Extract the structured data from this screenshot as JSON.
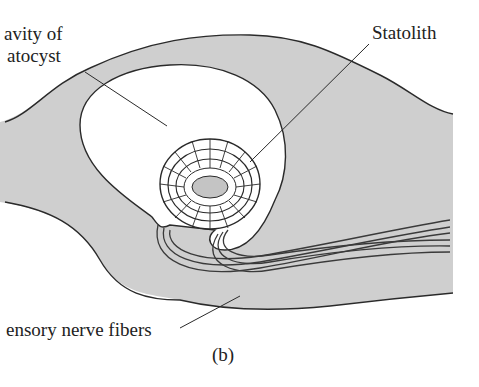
{
  "figure": {
    "panel_label": "(b)",
    "labels": {
      "cavity_line1": "avity of",
      "cavity_line2": "atocyst",
      "statolith": "Statolith",
      "nerve": "ensory nerve fibers"
    },
    "colors": {
      "tissue": "#cfcfcf",
      "outline": "#2a2a2a",
      "statolith": "#c4c4c4"
    }
  }
}
